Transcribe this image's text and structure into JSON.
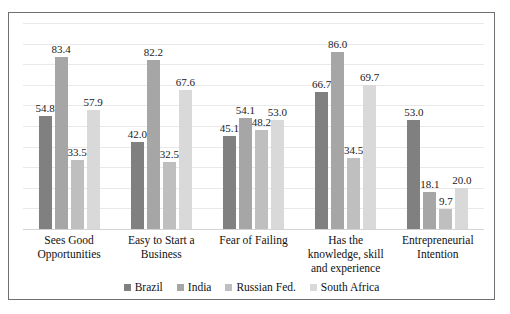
{
  "chart_data": {
    "type": "bar",
    "title": "",
    "subtitle": "",
    "xlabel": "",
    "ylabel": "",
    "ylim": [
      0,
      100
    ],
    "grid": true,
    "grid_interval": 10,
    "axis_tick_labels_visible": false,
    "legend_position": "bottom",
    "categories": [
      "Sees Good Opportunities",
      "Easy to Start a Business",
      "Fear of Failing",
      "Has the knowledge, skill and experience",
      "Entrepreneurial Intention"
    ],
    "category_lines": [
      [
        "Sees Good",
        "Opportunities"
      ],
      [
        "Easy to Start a",
        "Business"
      ],
      [
        "Fear of Failing"
      ],
      [
        "Has the",
        "knowledge, skill",
        "and experience"
      ],
      [
        "Entrepreneurial",
        "Intention"
      ]
    ],
    "series": [
      {
        "name": "Brazil",
        "color": "#808080",
        "values": [
          54.8,
          42.0,
          45.1,
          66.7,
          53.0
        ],
        "labels": [
          "54.8",
          "42.0",
          "45.1",
          "66.7",
          "53.0"
        ]
      },
      {
        "name": "India",
        "color": "#a6a6a6",
        "values": [
          83.4,
          82.2,
          54.1,
          86.0,
          18.1
        ],
        "labels": [
          "83.4",
          "82.2",
          "54.1",
          "86.0",
          "18.1"
        ]
      },
      {
        "name": "Russian Fed.",
        "color": "#bfbfbf",
        "values": [
          33.5,
          32.5,
          48.2,
          34.5,
          9.7
        ],
        "labels": [
          "33.5",
          "32.5",
          "48.2",
          "34.5",
          "9.7"
        ]
      },
      {
        "name": "South Africa",
        "color": "#d9d9d9",
        "values": [
          57.9,
          67.6,
          53.0,
          69.7,
          20.0
        ],
        "labels": [
          "57.9",
          "67.6",
          "53.0",
          "69.7",
          "20.0"
        ]
      }
    ]
  },
  "style": {
    "border_color": "#6f6f6f",
    "gridline_color": "#e9e9e9",
    "background": "#ffffff",
    "text_color": "#111111"
  }
}
